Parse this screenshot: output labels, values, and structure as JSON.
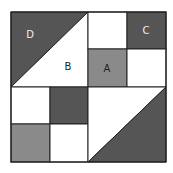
{
  "diagram": {
    "type": "quilt-block-grid",
    "colors": {
      "dark": "#555555",
      "medium": "#8a8a8a",
      "light": "#ffffff",
      "stroke": "#222222"
    },
    "labels": {
      "A": "A",
      "B": "B",
      "C": "C",
      "D": "D"
    },
    "pieces": [
      {
        "id": "D",
        "shape": "triangle",
        "color": "dark",
        "region": "top-left half-square, upper-left triangle"
      },
      {
        "id": "B",
        "shape": "triangle",
        "color": "light",
        "region": "top-left half-square, lower-right triangle"
      },
      {
        "id": "C",
        "shape": "square",
        "color": "dark",
        "region": "top-right, upper-right small square"
      },
      {
        "id": "A",
        "shape": "square",
        "color": "medium",
        "region": "top-right, lower-left small square"
      },
      {
        "shape": "square",
        "color": "light",
        "region": "top-right, upper-left small square"
      },
      {
        "shape": "square",
        "color": "light",
        "region": "top-right, lower-right small square"
      },
      {
        "shape": "square",
        "color": "light",
        "region": "bottom-left, upper-left small square"
      },
      {
        "shape": "square",
        "color": "dark",
        "region": "bottom-left, upper-right small square"
      },
      {
        "shape": "square",
        "color": "medium",
        "region": "bottom-left, lower-left small square"
      },
      {
        "shape": "square",
        "color": "light",
        "region": "bottom-left, lower-right small square"
      },
      {
        "shape": "triangle",
        "color": "light",
        "region": "bottom-right half-square, upper-left triangle"
      },
      {
        "shape": "triangle",
        "color": "dark",
        "region": "bottom-right half-square, lower-right triangle"
      }
    ]
  }
}
